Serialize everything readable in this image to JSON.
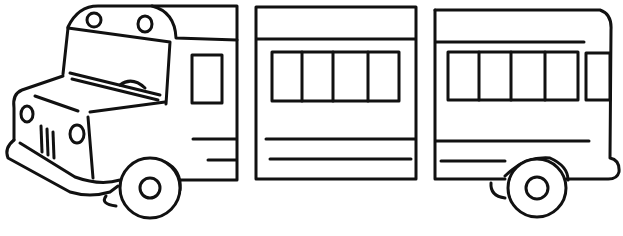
{
  "image": {
    "subject": "bus-line-drawing",
    "width": 623,
    "height": 236,
    "background": "#ffffff",
    "stroke": "#111111",
    "panels": [
      {
        "name": "front-section",
        "windows": 1,
        "wheels": 1
      },
      {
        "name": "middle-section",
        "windows": 4,
        "wheels": 0
      },
      {
        "name": "rear-section",
        "windows": 5,
        "wheels": 1
      }
    ]
  }
}
